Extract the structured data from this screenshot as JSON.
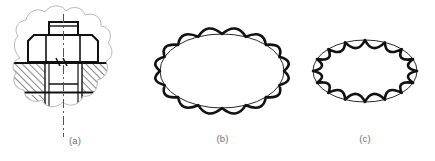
{
  "figure": {
    "background_color": "#ffffff",
    "ink_color": "#111111",
    "break_line_color": "#b9b9b9",
    "caption_color": "#6e6e6e",
    "panels": [
      {
        "id": "a",
        "caption": "(a)",
        "kind": "engineering-section-view",
        "description": "Sectioned assembly drawing of a hex bolt and nut clamping two hatched plates, bounded by an irregular cloud-shaped break line",
        "elements": [
          "hex-nut",
          "bolt-shank",
          "bolt-end-stub",
          "upper-hatched-plate",
          "lower-hatched-plate",
          "center-line",
          "cloud-break-boundary"
        ],
        "hatch_angle_deg": 45,
        "hatch_spacing_px": 4
      },
      {
        "id": "b",
        "caption": "(b)",
        "kind": "scalloped-ellipse-outward",
        "description": "Ellipse whose boundary is a chain of convex arcs bulging outward, drawn over a plain thin ellipse",
        "scallop_count": 16,
        "scallop_direction": "outward",
        "ellipse_rx": 62,
        "ellipse_ry": 37,
        "scallop_amplitude": 7,
        "outline_width": 2.6,
        "base_outline_width": 0.9
      },
      {
        "id": "c",
        "caption": "(c)",
        "kind": "scalloped-ellipse-inward",
        "description": "Ellipse whose boundary is a chain of concave arcs dipping inward, drawn inside a plain thin ellipse",
        "scallop_count": 16,
        "scallop_direction": "inward",
        "ellipse_rx": 52,
        "ellipse_ry": 31,
        "scallop_amplitude": 7,
        "outline_width": 2.6,
        "base_outline_width": 0.9
      }
    ]
  }
}
